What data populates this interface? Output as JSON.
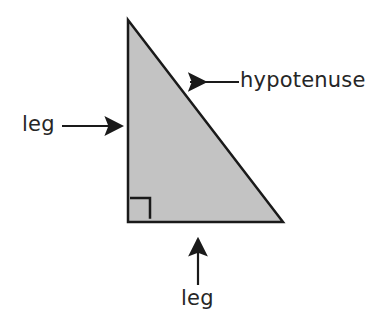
{
  "figure": {
    "kind": "geometry-diagram",
    "background_color": "#ffffff"
  },
  "shape": {
    "name": "right-triangle",
    "fill_color": "#c3c3c3",
    "stroke_color": "#1a1a1a",
    "stroke_width": 2.5,
    "vertices": {
      "apex": {
        "x": 128,
        "y": 20
      },
      "bottom_left": {
        "x": 128,
        "y": 222
      },
      "bottom_right": {
        "x": 283,
        "y": 222
      }
    },
    "points_path": "128,20 283,222 128,222"
  },
  "right_angle_marker": {
    "name": "right-angle-square",
    "x": 130,
    "y": 198,
    "size": 20,
    "stroke_color": "#1a1a1a",
    "stroke_width": 2.5,
    "fill": "none",
    "path": "M 130 198 L 150 198 L 150 220"
  },
  "annotations": [
    {
      "id": "hypotenuse",
      "label": "hypotenuse",
      "arrow_direction": "left",
      "arrow_tail": {
        "x": 239,
        "y": 82
      },
      "arrow_tip": {
        "x": 186,
        "y": 82
      },
      "points_at": "hypotenuse-edge",
      "color": "#1a1a1a"
    },
    {
      "id": "leg-vertical",
      "label": "leg",
      "arrow_direction": "right",
      "arrow_tail": {
        "x": 62,
        "y": 126
      },
      "arrow_tip": {
        "x": 126,
        "y": 126
      },
      "points_at": "vertical-leg-edge",
      "color": "#1a1a1a"
    },
    {
      "id": "leg-horizontal",
      "label": "leg",
      "arrow_direction": "up",
      "arrow_tail": {
        "x": 198,
        "y": 285
      },
      "arrow_tip": {
        "x": 198,
        "y": 235
      },
      "points_at": "horizontal-leg-edge",
      "color": "#1a1a1a"
    }
  ],
  "labels": {
    "hypotenuse": "hypotenuse",
    "leg_vertical": "leg",
    "leg_horizontal": "leg"
  }
}
